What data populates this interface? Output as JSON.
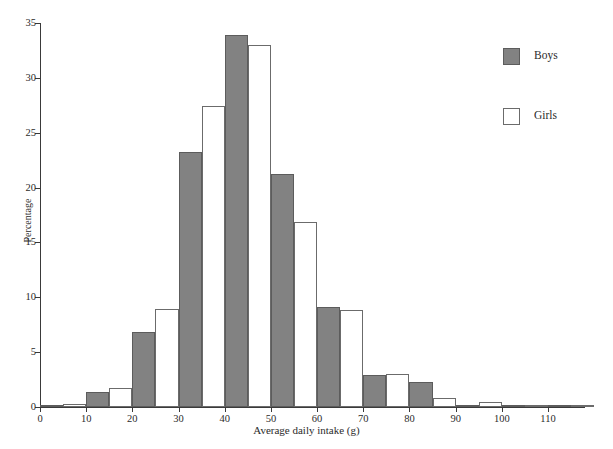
{
  "chart_data": {
    "type": "bar",
    "title": "",
    "xlabel": "Average daily intake (g)",
    "ylabel": "Percentage",
    "xlim": [
      0,
      118
    ],
    "ylim": [
      0,
      35
    ],
    "xticks": [
      0,
      10,
      20,
      30,
      40,
      50,
      60,
      70,
      80,
      90,
      100,
      110
    ],
    "yticks": [
      0,
      5,
      10,
      15,
      20,
      25,
      30,
      35
    ],
    "grid": false,
    "legend_position": "right",
    "bin_width": 10,
    "bin_starts": [
      0,
      10,
      20,
      30,
      40,
      50,
      60,
      70,
      80,
      90,
      100,
      110
    ],
    "categories": [
      "0-10",
      "10-20",
      "20-30",
      "30-40",
      "40-50",
      "50-60",
      "60-70",
      "70-80",
      "80-90",
      "90-100",
      "100-110",
      "110-120"
    ],
    "series": [
      {
        "name": "Boys",
        "color": "#828282",
        "values": [
          0.2,
          1.4,
          6.8,
          23.2,
          33.9,
          21.2,
          9.1,
          2.9,
          2.3,
          0.2,
          0.2,
          0.2
        ]
      },
      {
        "name": "Girls",
        "color": "#ffffff",
        "values": [
          0.3,
          1.7,
          8.9,
          27.4,
          33.0,
          16.9,
          8.8,
          3.0,
          0.8,
          0.5,
          0.1,
          0.2
        ]
      }
    ]
  },
  "legend": {
    "items": [
      {
        "label": "Boys",
        "swatch": "boys"
      },
      {
        "label": "Girls",
        "swatch": "girls"
      }
    ]
  },
  "axes": {
    "y_title": "Percentage",
    "x_title": "Average daily intake (g)"
  }
}
